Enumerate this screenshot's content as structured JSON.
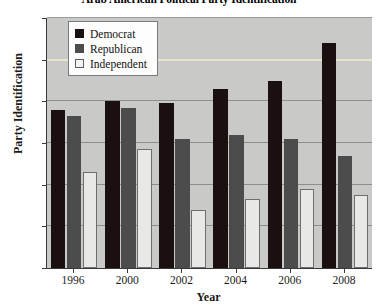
{
  "chart_data": {
    "type": "bar",
    "title": "Arab American Political Party Identification",
    "xlabel": "Year",
    "ylabel": "Party Identification",
    "categories": [
      "1996",
      "2000",
      "2002",
      "2004",
      "2006",
      "2008"
    ],
    "ylim": [
      0,
      60
    ],
    "ytick_labels": [
      "0%",
      "10%",
      "20%",
      "30%",
      "40%",
      "50%",
      "60%"
    ],
    "ytick_values": [
      0,
      10,
      20,
      30,
      40,
      50,
      60
    ],
    "grid": true,
    "legend_position": "upper-left-inside",
    "series": [
      {
        "name": "Democrat",
        "color": "#1a1010",
        "values": [
          38,
          40,
          39.5,
          43,
          45,
          54
        ]
      },
      {
        "name": "Republican",
        "color": "#4c4c4c",
        "values": [
          36.5,
          38.5,
          31,
          32,
          31,
          27
        ]
      },
      {
        "name": "Independent",
        "color": "#e8e8e6",
        "values": [
          23,
          28.5,
          14,
          16.5,
          19,
          17.5
        ]
      }
    ]
  }
}
